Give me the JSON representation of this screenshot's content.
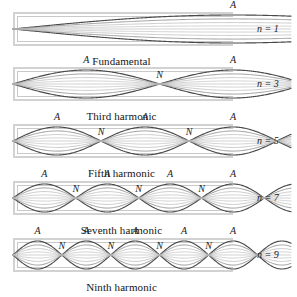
{
  "figure": {
    "tube_end_left": "closed",
    "tube_end_right": "open",
    "label_antinode": "A",
    "label_node": "N"
  },
  "colors": {
    "tube_wall": "#d2d2d2",
    "tube_wall_inner": "#c9c9c9",
    "wave_dark": "#4a4a4a",
    "wave_mid": "#8d8d8d",
    "wave_light": "#b4b4b4",
    "text": "#141414",
    "background": "#ffffff"
  },
  "panels": [
    {
      "id": "fundamental",
      "caption": "Fundamental",
      "mode_label": "n = 1",
      "harmonic": 1,
      "antinode_labels": [
        "A"
      ],
      "node_labels": [],
      "antinode_count": 1,
      "node_count": 0
    },
    {
      "id": "third-harmonic",
      "caption": "Third harmonic",
      "mode_label": "n = 3",
      "harmonic": 3,
      "antinode_labels": [
        "A",
        "A"
      ],
      "node_labels": [
        "N"
      ],
      "antinode_count": 2,
      "node_count": 1
    },
    {
      "id": "fifth-harmonic",
      "caption": "Fifth harmonic",
      "mode_label": "n = 5",
      "harmonic": 5,
      "antinode_labels": [
        "A",
        "A",
        "A"
      ],
      "node_labels": [
        "N",
        "N"
      ],
      "antinode_count": 3,
      "node_count": 2
    },
    {
      "id": "seventh-harmonic",
      "caption": "Seventh harmonic",
      "mode_label": "n = 7",
      "harmonic": 7,
      "antinode_labels": [
        "A",
        "A",
        "A",
        "A"
      ],
      "node_labels": [
        "N",
        "N",
        "N"
      ],
      "antinode_count": 4,
      "node_count": 3
    },
    {
      "id": "ninth-harmonic",
      "caption": "Ninth harmonic",
      "mode_label": "n = 9",
      "harmonic": 9,
      "antinode_labels": [
        "A",
        "A",
        "A",
        "A",
        "A"
      ],
      "node_labels": [
        "N",
        "N",
        "N",
        "N"
      ],
      "antinode_count": 5,
      "node_count": 4
    }
  ]
}
